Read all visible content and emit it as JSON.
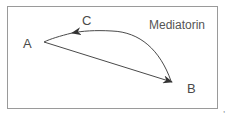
{
  "diagram": {
    "title": "Mediatorin",
    "nodes": [
      {
        "id": "A",
        "label": "A"
      },
      {
        "id": "B",
        "label": "B"
      },
      {
        "id": "C",
        "label": "C"
      }
    ],
    "edges": [
      {
        "from": "A",
        "to": "B",
        "type": "straight-arrow"
      },
      {
        "from": "B",
        "to": "A",
        "via": "C",
        "type": "curved-arrow"
      }
    ],
    "colors": {
      "line": "#4a4a4a",
      "frame": "#9a9a9a"
    },
    "trailing_mark": ","
  }
}
